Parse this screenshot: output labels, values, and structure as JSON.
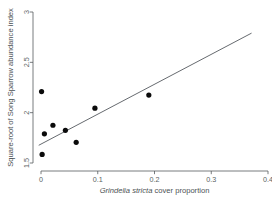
{
  "chart_data": {
    "type": "scatter",
    "title": "",
    "xlabel": "Grindelia stricta cover proportion",
    "xlabel_parts": [
      {
        "text": "Grindelia",
        "italic": true
      },
      {
        "text": " stricta",
        "italic": true
      },
      {
        "text": " cover proportion",
        "italic": false
      }
    ],
    "ylabel": "Square-root of Song Sparrow abundance index",
    "xlim": [
      0,
      0.4
    ],
    "ylim": [
      1.42,
      3.04
    ],
    "xticks": [
      0,
      0.1,
      0.2,
      0.3,
      0.4
    ],
    "xtick_labels": [
      "0",
      "0.1",
      "0.2",
      "0.3",
      "0.4"
    ],
    "yticks": [
      1.5,
      2,
      2.5,
      3
    ],
    "ytick_labels": [
      "1.5",
      "2",
      "2.5",
      "3"
    ],
    "grid": false,
    "legend": null,
    "series": [
      {
        "name": "Song Sparrow abundance vs Grindelia cover",
        "marker": "filled-circle",
        "color": "#0b0b0b",
        "points": [
          {
            "x": 0.001,
            "y": 2.21
          },
          {
            "x": 0.002,
            "y": 1.585
          },
          {
            "x": 0.006,
            "y": 1.79
          },
          {
            "x": 0.021,
            "y": 1.875
          },
          {
            "x": 0.043,
            "y": 1.825
          },
          {
            "x": 0.062,
            "y": 1.705
          },
          {
            "x": 0.095,
            "y": 2.045
          },
          {
            "x": 0.19,
            "y": 2.175
          }
        ]
      }
    ],
    "fit_line": {
      "name": "linear regression fit",
      "color": "#4a4f55",
      "x_start": -0.004,
      "y_start": 1.676,
      "x_end": 0.371,
      "y_end": 2.79
    }
  }
}
